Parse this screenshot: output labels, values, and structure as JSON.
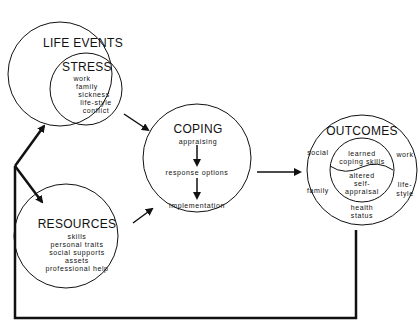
{
  "diagram": {
    "type": "stress-coping model",
    "colors": {
      "line": "#111111",
      "background": "#ffffff"
    },
    "nodes": {
      "life_events": {
        "title": "LIFE EVENTS",
        "stress": {
          "title": "STRESS",
          "items": [
            "work",
            "family",
            "sickness",
            "life-style",
            "conflict"
          ]
        }
      },
      "resources": {
        "title": "RESOURCES",
        "items": [
          "skills",
          "personal traits",
          "social supports",
          "assets",
          "professional help"
        ]
      },
      "coping": {
        "title": "COPING",
        "steps": [
          "appraising",
          "response options",
          "implementation"
        ]
      },
      "outcomes": {
        "title": "OUTCOMES",
        "outer_items": {
          "social": "social",
          "work": "work",
          "family": "family",
          "lifestyle_1": "life-",
          "lifestyle_2": "style",
          "health_1": "health",
          "health_2": "status"
        },
        "inner_items": {
          "learned_1": "learned",
          "learned_2": "coping skills",
          "altered_1": "altered",
          "altered_2": "self-",
          "altered_3": "appraisal"
        }
      }
    },
    "edges": [
      {
        "from": "feedback-loop",
        "to": "life_events"
      },
      {
        "from": "feedback-loop",
        "to": "resources"
      },
      {
        "from": "life_events",
        "to": "coping"
      },
      {
        "from": "resources",
        "to": "coping"
      },
      {
        "from": "coping",
        "to": "outcomes"
      },
      {
        "from": "outcomes",
        "to": "feedback-loop"
      }
    ]
  }
}
